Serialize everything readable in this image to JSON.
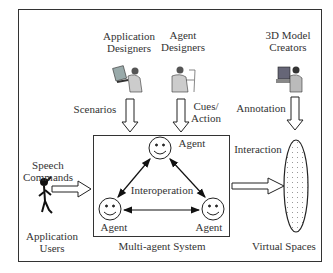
{
  "diagram": {
    "actors": {
      "app_designers": "Application\nDesigners",
      "agent_designers": "Agent\nDesigners",
      "model_creators": "3D Model\nCreators",
      "app_users": "Application\nUsers"
    },
    "flows": {
      "scenarios": "Scenarios",
      "cues_action": "Cues/\nAction",
      "annotation": "Annotation",
      "speech_commands": "Speech\nCommands",
      "interaction": "Interaction"
    },
    "system": {
      "title": "Multi-agent System",
      "center_label": "Interoperation",
      "agents": [
        "Agent",
        "Agent",
        "Agent"
      ]
    },
    "target": "Virtual Spaces"
  }
}
